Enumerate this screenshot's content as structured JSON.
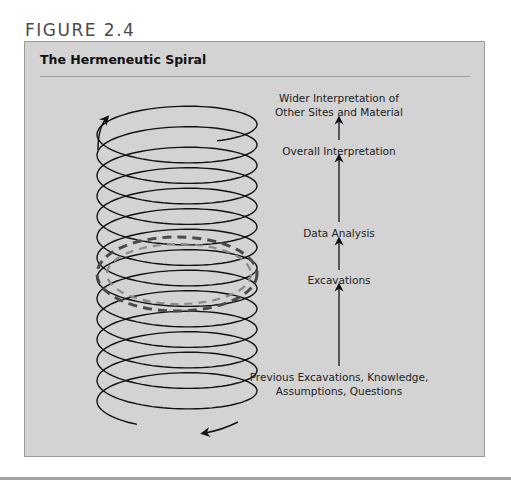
{
  "figure": {
    "label": "FIGURE 2.4",
    "title": "The Hermeneutic Spiral"
  },
  "spiral": {
    "coil_count": 14,
    "direction": "upward",
    "highlight": "dashed rings mark current cycle of interpretation",
    "colors": {
      "line": "#111111",
      "dashed_outer": "#4a4a4a",
      "dashed_inner": "#8a8a8a"
    }
  },
  "steps": [
    {
      "id": "previous",
      "lines": [
        "Previous Excavations, Knowledge,",
        "Assumptions, Questions"
      ]
    },
    {
      "id": "excavations",
      "lines": [
        "Excavations"
      ]
    },
    {
      "id": "data-analysis",
      "lines": [
        "Data Analysis"
      ]
    },
    {
      "id": "overall",
      "lines": [
        "Overall Interpretation"
      ]
    },
    {
      "id": "wider",
      "lines": [
        "Wider Interpretation of",
        "Other Sites and Material"
      ]
    }
  ],
  "colors": {
    "panel": "#d3d3d3",
    "border": "#9a9a9a",
    "text": "#222222"
  }
}
